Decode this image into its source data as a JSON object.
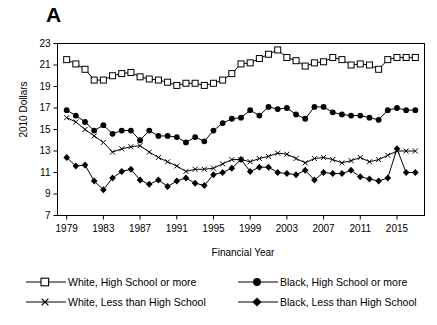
{
  "panel": {
    "letter": "A"
  },
  "axes": {
    "ylabel": "2010 Dollars",
    "xlabel": "Financial Year"
  },
  "legend": {
    "entries": [
      {
        "label": "White, High School or more",
        "marker": "open-square",
        "color": "#000000"
      },
      {
        "label": "Black, High School or more",
        "marker": "filled-circle",
        "color": "#000000"
      },
      {
        "label": "White, Less than High School",
        "marker": "cross-x",
        "color": "#000000"
      },
      {
        "label": "Black, Less than High School",
        "marker": "filled-diamond",
        "color": "#000000"
      }
    ]
  },
  "chart_data": {
    "type": "line",
    "title": "A",
    "xlabel": "Financial Year",
    "ylabel": "2010 Dollars",
    "xlim": [
      1978,
      2018
    ],
    "ylim": [
      7,
      23
    ],
    "yticks": [
      7,
      9,
      11,
      13,
      15,
      17,
      19,
      21,
      23
    ],
    "xticks": [
      1979,
      1983,
      1987,
      1991,
      1995,
      1999,
      2003,
      2007,
      2011,
      2015
    ],
    "grid": false,
    "legend_position": "bottom",
    "x": [
      1979,
      1980,
      1981,
      1982,
      1983,
      1984,
      1985,
      1986,
      1987,
      1988,
      1989,
      1990,
      1991,
      1992,
      1993,
      1994,
      1995,
      1996,
      1997,
      1998,
      1999,
      2000,
      2001,
      2002,
      2003,
      2004,
      2005,
      2006,
      2007,
      2008,
      2009,
      2010,
      2011,
      2012,
      2013,
      2014,
      2015,
      2016,
      2017
    ],
    "series": [
      {
        "name": "White, High School or more",
        "marker": "open-square",
        "values": [
          21.5,
          21.1,
          20.6,
          19.6,
          19.6,
          20.0,
          20.2,
          20.3,
          19.9,
          19.7,
          19.6,
          19.4,
          19.1,
          19.3,
          19.3,
          19.1,
          19.3,
          19.6,
          20.2,
          21.1,
          21.2,
          21.6,
          22.0,
          22.4,
          21.7,
          21.4,
          20.9,
          21.2,
          21.3,
          21.7,
          21.5,
          21.0,
          21.1,
          21.0,
          20.6,
          21.5,
          21.7,
          21.7,
          21.7
        ]
      },
      {
        "name": "Black, High School or more",
        "marker": "filled-circle",
        "values": [
          16.8,
          16.3,
          15.7,
          14.9,
          15.4,
          14.6,
          14.9,
          14.9,
          14.0,
          14.9,
          14.4,
          14.4,
          14.3,
          13.8,
          14.3,
          13.9,
          14.9,
          15.6,
          16.0,
          16.1,
          16.8,
          16.3,
          17.1,
          16.9,
          17.0,
          16.4,
          16.0,
          17.1,
          17.1,
          16.6,
          16.4,
          16.3,
          16.3,
          16.1,
          15.9,
          16.8,
          17.0,
          16.8,
          16.8
        ]
      },
      {
        "name": "White, Less than High School",
        "marker": "cross-x",
        "values": [
          16.1,
          15.7,
          15.0,
          14.4,
          13.8,
          12.9,
          13.2,
          13.4,
          13.5,
          12.9,
          12.4,
          12.0,
          11.6,
          11.1,
          11.3,
          11.3,
          11.4,
          11.8,
          12.2,
          12.2,
          12.0,
          12.3,
          12.5,
          12.8,
          12.7,
          12.3,
          11.9,
          12.3,
          12.4,
          12.2,
          11.9,
          12.1,
          12.4,
          12.0,
          12.2,
          12.6,
          13.0,
          13.0,
          13.0
        ]
      },
      {
        "name": "Black, Less than High School",
        "marker": "filled-diamond",
        "values": [
          12.4,
          11.6,
          11.7,
          10.2,
          9.4,
          10.5,
          11.1,
          11.3,
          10.3,
          9.9,
          10.3,
          9.7,
          10.2,
          10.5,
          10.0,
          9.8,
          10.8,
          11.0,
          11.4,
          12.2,
          11.1,
          11.5,
          11.5,
          11.0,
          10.9,
          10.8,
          11.2,
          10.3,
          11.0,
          10.9,
          10.9,
          11.2,
          10.6,
          10.4,
          10.2,
          10.5,
          13.2,
          11.0,
          11.0
        ]
      }
    ]
  }
}
